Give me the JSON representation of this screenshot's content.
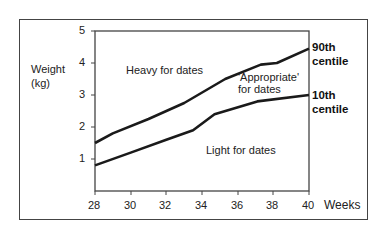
{
  "chart_data": {
    "type": "line",
    "title": "",
    "xlabel": "Weeks",
    "ylabel": "Weight (kg)",
    "xlim": [
      28,
      40
    ],
    "ylim": [
      0,
      5
    ],
    "x_ticks": [
      "28",
      "30",
      "32",
      "34",
      "36",
      "38",
      "40"
    ],
    "y_ticks": [
      "1",
      "2",
      "3",
      "4",
      "5"
    ],
    "grid": false,
    "series": [
      {
        "name": "90th centile",
        "x": [
          28,
          29,
          31,
          33,
          35.3,
          37.3,
          38.2,
          40
        ],
        "values": [
          1.5,
          1.8,
          2.25,
          2.75,
          3.5,
          3.95,
          4.0,
          4.45
        ]
      },
      {
        "name": "10th centile",
        "x": [
          28,
          30,
          32,
          33.5,
          34.7,
          37.1,
          40
        ],
        "values": [
          0.8,
          1.2,
          1.6,
          1.9,
          2.4,
          2.8,
          3.0
        ]
      }
    ],
    "annotations": [
      "Heavy for dates",
      "'Appropriate' for dates",
      "Light for dates"
    ]
  },
  "axis": {
    "y_label_line1": "Weight",
    "y_label_line2": "(kg)",
    "x_label": "Weeks",
    "y_ticks": [
      {
        "label": "5",
        "y": 31
      },
      {
        "label": "4",
        "y": 63
      },
      {
        "label": "3",
        "y": 95
      },
      {
        "label": "2",
        "y": 127
      },
      {
        "label": "1",
        "y": 159
      }
    ],
    "x_ticks": [
      {
        "label": "28",
        "x": 95
      },
      {
        "label": "30",
        "x": 131
      },
      {
        "label": "32",
        "x": 166
      },
      {
        "label": "34",
        "x": 202
      },
      {
        "label": "36",
        "x": 238
      },
      {
        "label": "38",
        "x": 273
      },
      {
        "label": "40",
        "x": 309
      }
    ]
  },
  "labels": {
    "heavy": "Heavy for dates",
    "appropriate_line1": "'Appropriate'",
    "appropriate_line2": "for dates",
    "light": "Light for dates",
    "p90_line1": "90th",
    "p90_line2": "centile",
    "p10_line1": "10th",
    "p10_line2": "centile"
  },
  "colors": {
    "line": "#1a1a1a",
    "axis": "#444444",
    "frame": "#444444"
  }
}
